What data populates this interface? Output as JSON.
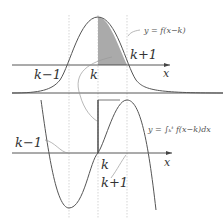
{
  "diagram": {
    "top_graph": {
      "curve_label": "y = f(x−k)",
      "labels": {
        "k_minus_1": "k−1",
        "k": "k",
        "k_plus_1": "k+1",
        "x_axis": "x"
      },
      "shaded_region": "area under f(x−k) from k to k+1"
    },
    "bottom_graph": {
      "curve_label": "y = ∫ₖᵗ f(x−k)dx",
      "labels": {
        "k_minus_1": "k−1",
        "k": "k",
        "k_plus_1": "k+1",
        "x_axis": "x"
      }
    },
    "colors": {
      "curve": "#555555",
      "axis": "#444444",
      "shade": "#aaaaaa",
      "dashed": "#bbbbbb"
    }
  }
}
